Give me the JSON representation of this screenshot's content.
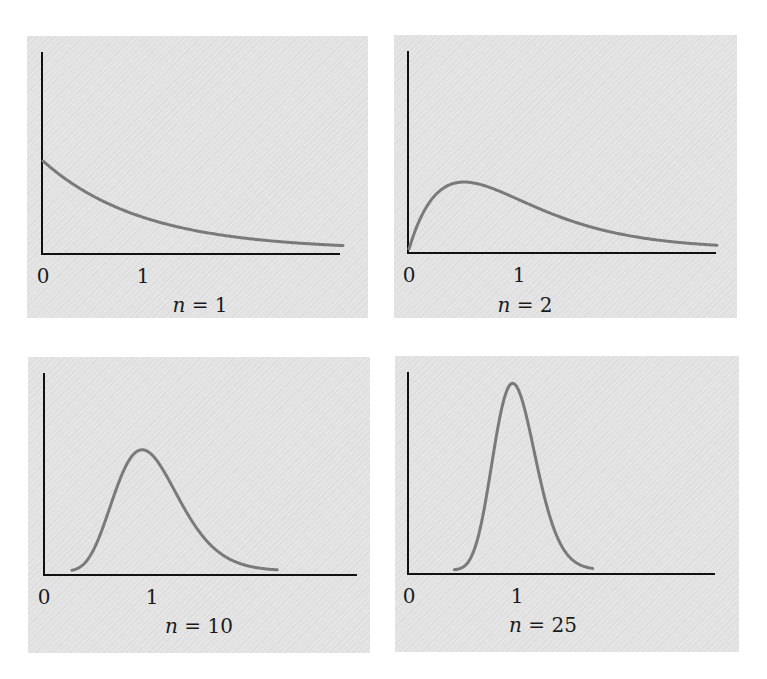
{
  "figure": {
    "background": "#ffffff",
    "panel_color": "#e3e3e3",
    "axis_color": "#111111",
    "curve_color": "#7a7a7a"
  },
  "panels": [
    {
      "id": "n1",
      "n_var": "n",
      "n_eq": " = 1",
      "tick0": "0",
      "tick1": "1"
    },
    {
      "id": "n2",
      "n_var": "n",
      "n_eq": " = 2",
      "tick0": "0",
      "tick1": "1"
    },
    {
      "id": "n10",
      "n_var": "n",
      "n_eq": " = 10",
      "tick0": "0",
      "tick1": "1"
    },
    {
      "id": "n25",
      "n_var": "n",
      "n_eq": " = 25",
      "tick0": "0",
      "tick1": "1"
    }
  ],
  "chart_data": [
    {
      "type": "line",
      "title": "n = 1",
      "xlabel": "",
      "ylabel": "",
      "x_ticks": [
        0,
        1
      ],
      "x_tick_labels": [
        "0",
        "1"
      ],
      "xlim": [
        0,
        3.1
      ],
      "grid": false,
      "legend": "none",
      "distribution": "gamma(shape=1, rate=1) density of sample mean x̄",
      "series": [
        {
          "name": "density",
          "n": 1,
          "x": [
            0,
            0.25,
            0.5,
            0.75,
            1.0,
            1.5,
            2.0,
            2.5,
            3.0
          ],
          "y": [
            1.0,
            0.78,
            0.61,
            0.47,
            0.37,
            0.22,
            0.14,
            0.08,
            0.05
          ]
        }
      ]
    },
    {
      "type": "line",
      "title": "n = 2",
      "xlabel": "",
      "ylabel": "",
      "x_ticks": [
        0,
        1
      ],
      "x_tick_labels": [
        "0",
        "1"
      ],
      "xlim": [
        0,
        3.1
      ],
      "grid": false,
      "legend": "none",
      "distribution": "gamma(shape=2, rate=2) density of sample mean x̄",
      "series": [
        {
          "name": "density",
          "n": 2,
          "x": [
            0,
            0.25,
            0.5,
            0.75,
            1.0,
            1.5,
            2.0,
            2.5,
            3.0
          ],
          "y": [
            0,
            0.61,
            0.74,
            0.67,
            0.54,
            0.3,
            0.15,
            0.07,
            0.03
          ]
        }
      ]
    },
    {
      "type": "line",
      "title": "n = 10",
      "xlabel": "",
      "ylabel": "",
      "x_ticks": [
        0,
        1
      ],
      "x_tick_labels": [
        "0",
        "1"
      ],
      "xlim": [
        0,
        3.1
      ],
      "grid": false,
      "legend": "none",
      "distribution": "gamma(shape=10, rate=10) density of sample mean x̄",
      "series": [
        {
          "name": "density",
          "n": 10,
          "x": [
            0.3,
            0.5,
            0.7,
            0.9,
            1.0,
            1.2,
            1.5,
            1.8,
            2.3
          ],
          "y": [
            0.03,
            0.36,
            1.01,
            1.32,
            1.25,
            0.84,
            0.29,
            0.07,
            0.0
          ]
        }
      ]
    },
    {
      "type": "line",
      "title": "n = 25",
      "xlabel": "",
      "ylabel": "",
      "x_ticks": [
        0,
        1
      ],
      "x_tick_labels": [
        "0",
        "1"
      ],
      "xlim": [
        0,
        3.1
      ],
      "grid": false,
      "legend": "none",
      "distribution": "gamma(shape=25, rate=25) density of sample mean x̄",
      "series": [
        {
          "name": "density",
          "n": 25,
          "x": [
            0.5,
            0.7,
            0.85,
            0.96,
            1.0,
            1.15,
            1.3,
            1.5,
            1.8
          ],
          "y": [
            0.04,
            0.77,
            1.78,
            2.03,
            1.99,
            1.32,
            0.51,
            0.07,
            0.0
          ]
        }
      ]
    }
  ]
}
